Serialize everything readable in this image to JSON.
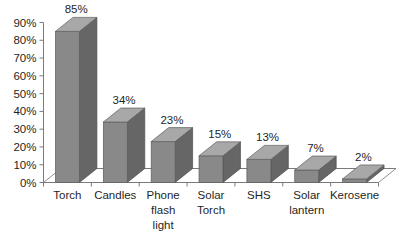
{
  "chart_data": {
    "type": "bar",
    "title": "",
    "subtitle": "",
    "xlabel": "",
    "ylabel": "",
    "categories": [
      "Torch",
      "Candles",
      "Phone flash light",
      "Solar Torch",
      "SHS",
      "Solar lantern",
      "Kerosene"
    ],
    "values": [
      85,
      34,
      23,
      15,
      13,
      7,
      2
    ],
    "data_labels": [
      "85%",
      "34%",
      "23%",
      "15%",
      "13%",
      "7%",
      "2%"
    ],
    "ylim": [
      0,
      90
    ],
    "ytick_values": [
      0,
      10,
      20,
      30,
      40,
      50,
      60,
      70,
      80,
      90
    ],
    "ytick_labels": [
      "0%",
      "10%",
      "20%",
      "30%",
      "40%",
      "50%",
      "60%",
      "70%",
      "80%",
      "90%"
    ],
    "grid": false,
    "legend": false,
    "legend_position": "none",
    "style": "3d-column",
    "series": [
      {
        "name": "Share of households",
        "values": [
          85,
          34,
          23,
          15,
          13,
          7,
          2
        ]
      }
    ],
    "colors": {
      "bar_front": "#898989",
      "bar_top": "#a8a8a8",
      "bar_side": "#666666",
      "axis": "#7a7a7a",
      "text": "#1f1f1f",
      "background": "#ffffff"
    }
  }
}
